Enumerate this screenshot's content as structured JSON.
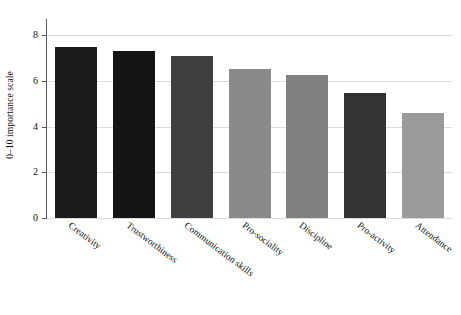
{
  "chart_data": {
    "type": "bar",
    "title": "",
    "xlabel": "",
    "ylabel": "0–10 importance scale",
    "ylim": [
      0,
      8.35
    ],
    "yticks": [
      0,
      2,
      4,
      6,
      8
    ],
    "ytick_labels": [
      "0",
      "2",
      "4",
      "6",
      "8"
    ],
    "grid": true,
    "legend": "none",
    "categories": [
      "Creativity",
      "Trustworthiness",
      "Communication skills",
      "Pro-sociality",
      "Discipline",
      "Pro-activity",
      "Attendance"
    ],
    "values": [
      7.5,
      7.3,
      7.1,
      6.55,
      6.25,
      5.5,
      4.6
    ],
    "bar_colors": [
      "#1b1b1b",
      "#141414",
      "#3f3f3f",
      "#8a8a8a",
      "#808080",
      "#333333",
      "#9a9a9a"
    ]
  },
  "axes": {
    "y_axis_title": "0–10 importance scale",
    "grid_color": "#dcdcdc",
    "axis_color": "#5a5a5a"
  }
}
